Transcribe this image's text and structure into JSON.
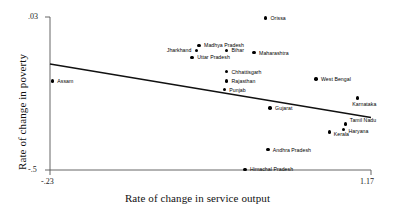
{
  "chart_data": {
    "type": "scatter",
    "title": "",
    "xlabel": "Rate of change in service output",
    "ylabel": "Rate of change in poverty",
    "xlim": [
      -0.23,
      1.17
    ],
    "ylim": [
      -0.5,
      0.03
    ],
    "xticks": [
      "-.23",
      "1.17"
    ],
    "yticks": [
      ".03",
      "-.5"
    ],
    "grid": false,
    "legend": "none",
    "fit_line": {
      "label": "linear fit",
      "x_start": -0.23,
      "y_start": -0.133,
      "x_end": 1.17,
      "y_end": -0.318
    },
    "points": [
      {
        "label": "Orissa",
        "x": 0.71,
        "y": 0.026
      },
      {
        "label": "Madhya Pradesh",
        "x": 0.42,
        "y": -0.068
      },
      {
        "label": "Jharkhand",
        "x": 0.41,
        "y": -0.086
      },
      {
        "label": "Bihar",
        "x": 0.54,
        "y": -0.086
      },
      {
        "label": "Uttar Pradesh",
        "x": 0.39,
        "y": -0.11
      },
      {
        "label": "Maharashtra",
        "x": 0.66,
        "y": -0.094
      },
      {
        "label": "Chhattisgarh",
        "x": 0.54,
        "y": -0.159
      },
      {
        "label": "Rajasthan",
        "x": 0.54,
        "y": -0.192
      },
      {
        "label": "Punjab",
        "x": 0.53,
        "y": -0.222
      },
      {
        "label": "Assam",
        "x": -0.22,
        "y": -0.192
      },
      {
        "label": "West Bengal",
        "x": 0.93,
        "y": -0.185
      },
      {
        "label": "Karnataka",
        "x": 1.11,
        "y": -0.25
      },
      {
        "label": "Gujarat",
        "x": 0.73,
        "y": -0.285
      },
      {
        "label": "Tamil Nadu",
        "x": 1.06,
        "y": -0.34
      },
      {
        "label": "Haryana",
        "x": 1.05,
        "y": -0.36
      },
      {
        "label": "Kerala",
        "x": 0.99,
        "y": -0.368
      },
      {
        "label": "Andhra Pradesh",
        "x": 0.72,
        "y": -0.43
      },
      {
        "label": "Himachal Pradesh",
        "x": 0.62,
        "y": -0.498
      }
    ]
  },
  "labels": {
    "Orissa": {
      "text": "Orissa",
      "dx": 5,
      "dy": -2
    },
    "Madhya Pradesh": {
      "text": "Madhya Pradesh",
      "dx": 5,
      "dy": -2
    },
    "Jharkhand": {
      "text": "Jharkhand",
      "dx": -30,
      "dy": -2
    },
    "Bihar": {
      "text": "Bihar",
      "dx": 5,
      "dy": -2
    },
    "Uttar Pradesh": {
      "text": "Uttar Pradesh",
      "dx": 5,
      "dy": -2
    },
    "Maharashtra": {
      "text": "Maharashtra",
      "dx": 5,
      "dy": -2
    },
    "Chhattisgarh": {
      "text": "Chhattisgarh",
      "dx": 5,
      "dy": -2
    },
    "Rajasthan": {
      "text": "Rajasthan",
      "dx": 5,
      "dy": -2
    },
    "Punjab": {
      "text": "Punjab",
      "dx": 5,
      "dy": -2
    },
    "Assam": {
      "text": "Assam",
      "dx": 5,
      "dy": -2
    },
    "West Bengal": {
      "text": "West Bengal",
      "dx": 5,
      "dy": -2
    },
    "Karnataka": {
      "text": "Karnataka",
      "dx": -5,
      "dy": 4
    },
    "Gujarat": {
      "text": "Gujarat",
      "dx": 5,
      "dy": -2
    },
    "Tamil Nadu": {
      "text": "Tamil Nadu",
      "dx": 4,
      "dy": -6
    },
    "Haryana": {
      "text": "Haryana",
      "dx": 5,
      "dy": -1
    },
    "Kerala": {
      "text": "Kerala",
      "dx": 4,
      "dy": 0
    },
    "Andhra Pradesh": {
      "text": "Andhra Pradesh",
      "dx": 5,
      "dy": -2
    },
    "Himachal Pradesh": {
      "text": "Himachal Pradesh",
      "dx": 5,
      "dy": -2
    }
  },
  "colors": {
    "point": "#000000",
    "line": "#111111",
    "axis": "#555555",
    "text": "#111111"
  }
}
